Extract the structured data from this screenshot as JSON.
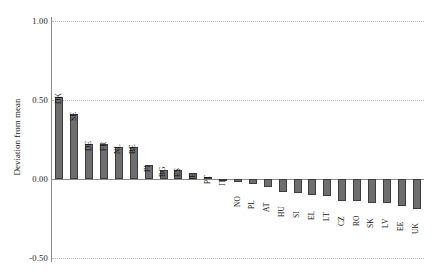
{
  "chart_data": {
    "type": "bar",
    "title": "",
    "xlabel": "",
    "ylabel": "Deviation from mean",
    "ylim": [
      -0.5,
      1.0
    ],
    "yticks": [
      "1.00",
      "0.50",
      "0.00",
      "-0.50"
    ],
    "ytick_values": [
      1.0,
      0.5,
      0.0,
      -0.5
    ],
    "grid": true,
    "legend": "none",
    "bar_color": "#6e6e6e",
    "bar_edge_color": "#3d3d3d",
    "categories": [
      "DK",
      "SE",
      "DE",
      "FR",
      "NL",
      "BE",
      "FI",
      "BG",
      "ES",
      "IE",
      "PT",
      "IT",
      "NO",
      "PL",
      "AT",
      "HU",
      "SI",
      "EL",
      "LT",
      "CZ",
      "RO",
      "SK",
      "LV",
      "EE",
      "UK"
    ],
    "values": [
      0.52,
      0.41,
      0.22,
      0.22,
      0.2,
      0.2,
      0.09,
      0.06,
      0.06,
      0.04,
      0.01,
      0.0,
      -0.02,
      -0.03,
      -0.05,
      -0.08,
      -0.09,
      -0.1,
      -0.11,
      -0.14,
      -0.14,
      -0.15,
      -0.15,
      -0.17,
      -0.19
    ]
  }
}
